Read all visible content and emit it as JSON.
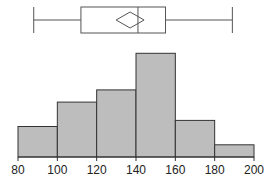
{
  "chart_data": [
    {
      "type": "boxplot",
      "title": "",
      "orientation": "horizontal",
      "min": 88,
      "q1": 112,
      "median": 141,
      "mean": 137,
      "q3": 155,
      "max": 189,
      "mean_marker": "diamond"
    },
    {
      "type": "bar",
      "subtype": "histogram",
      "title": "",
      "xlabel": "",
      "ylabel": "",
      "bin_edges": [
        80,
        100,
        120,
        140,
        160,
        180,
        200
      ],
      "categories": [
        "80-100",
        "100-120",
        "120-140",
        "140-160",
        "160-180",
        "180-200"
      ],
      "values": [
        5,
        9,
        11,
        17,
        6,
        2
      ],
      "xlim": [
        80,
        200
      ],
      "xticks": [
        "80",
        "100",
        "120",
        "140",
        "160",
        "180",
        "200"
      ],
      "grid": false,
      "bar_color": "#bdbdbd",
      "edge_color": "#333333"
    }
  ]
}
